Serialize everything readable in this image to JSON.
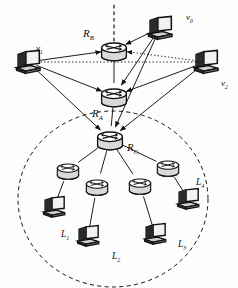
{
  "diagram": {
    "background_color": "#fdfdfd",
    "stroke_color": "#111111",
    "router_fill": "#d9d9d9",
    "host_fill": "#e8e8e8",
    "boundary": {
      "name": "lan-boundary",
      "shape": "dashed-circle",
      "cx": 113,
      "cy": 199,
      "rx": 95,
      "ry": 88,
      "style": "dashed"
    },
    "uplink": {
      "name": "backbone-uplink",
      "style": "dashed",
      "from_x": 114,
      "from_y": 48,
      "to_x": 114,
      "to_y": 2
    },
    "routers": [
      {
        "id": "RB",
        "label": "R",
        "sub": "B",
        "x": 114,
        "y": 50,
        "lx": 83,
        "ly": 28,
        "kind": "backbone"
      },
      {
        "id": "RA",
        "label": "R",
        "sub": "A",
        "x": 114,
        "y": 96,
        "lx": 92,
        "ly": 108,
        "kind": "backbone"
      },
      {
        "id": "RC",
        "label": "R",
        "sub": "C",
        "x": 110,
        "y": 139,
        "lx": 127,
        "ly": 142,
        "kind": "backbone"
      },
      {
        "id": "LR1",
        "label": "",
        "sub": "",
        "x": 68,
        "y": 170,
        "kind": "lan"
      },
      {
        "id": "LR2",
        "label": "",
        "sub": "",
        "x": 97,
        "y": 186,
        "kind": "lan"
      },
      {
        "id": "LR3",
        "label": "",
        "sub": "",
        "x": 140,
        "y": 185,
        "kind": "lan"
      },
      {
        "id": "LR4",
        "label": "",
        "sub": "",
        "x": 168,
        "y": 167,
        "kind": "lan"
      }
    ],
    "hosts": [
      {
        "id": "v0",
        "label": "v",
        "sub": "0",
        "x": 160,
        "y": 28,
        "lx": 186,
        "ly": 13,
        "group": "external"
      },
      {
        "id": "v1",
        "label": "v",
        "sub": "1",
        "x": 28,
        "y": 62,
        "lx": 36,
        "ly": 44,
        "group": "external"
      },
      {
        "id": "v2",
        "label": "v",
        "sub": "2",
        "x": 206,
        "y": 62,
        "lx": 221,
        "ly": 79,
        "group": "external"
      },
      {
        "id": "L1",
        "label": "L",
        "sub": "1",
        "x": 54,
        "y": 207,
        "lx": 61,
        "ly": 230,
        "group": "lan"
      },
      {
        "id": "L2",
        "label": "L",
        "sub": "2",
        "x": 88,
        "y": 236,
        "lx": 112,
        "ly": 252,
        "group": "lan"
      },
      {
        "id": "L3",
        "label": "L",
        "sub": "3",
        "x": 155,
        "y": 234,
        "lx": 178,
        "ly": 240,
        "group": "lan"
      },
      {
        "id": "L4",
        "label": "L",
        "sub": "4",
        "x": 188,
        "y": 199,
        "lx": 196,
        "ly": 178,
        "group": "lan"
      }
    ],
    "links": [
      {
        "from": "RB",
        "to": "RA",
        "style": "solid",
        "arrow": "none"
      },
      {
        "from": "RA",
        "to": "RC",
        "style": "solid",
        "arrow": "none"
      },
      {
        "from": "v1",
        "to": "RB",
        "style": "solid",
        "arrow": "to"
      },
      {
        "from": "v1",
        "to": "RA",
        "style": "solid",
        "arrow": "to"
      },
      {
        "from": "v1",
        "to": "RC",
        "style": "solid",
        "arrow": "to"
      },
      {
        "from": "v0",
        "to": "RB",
        "style": "solid",
        "arrow": "to"
      },
      {
        "from": "v0",
        "to": "RA",
        "style": "solid",
        "arrow": "to"
      },
      {
        "from": "v0",
        "to": "RC",
        "style": "solid",
        "arrow": "to"
      },
      {
        "from": "v2",
        "to": "RB",
        "style": "dotted",
        "arrow": "to"
      },
      {
        "from": "v2",
        "to": "RA",
        "style": "solid",
        "arrow": "to"
      },
      {
        "from": "v2",
        "to": "RC",
        "style": "solid",
        "arrow": "to"
      },
      {
        "from": "v1",
        "to": "v2",
        "style": "dotted",
        "arrow": "none"
      },
      {
        "from": "RC",
        "to": "LR1",
        "style": "solid",
        "arrow": "none"
      },
      {
        "from": "RC",
        "to": "LR2",
        "style": "solid",
        "arrow": "none"
      },
      {
        "from": "RC",
        "to": "LR3",
        "style": "solid",
        "arrow": "none"
      },
      {
        "from": "RC",
        "to": "LR4",
        "style": "solid",
        "arrow": "none"
      },
      {
        "from": "LR1",
        "to": "L1",
        "style": "solid",
        "arrow": "none"
      },
      {
        "from": "LR2",
        "to": "L2",
        "style": "solid",
        "arrow": "none"
      },
      {
        "from": "LR3",
        "to": "L3",
        "style": "solid",
        "arrow": "none"
      },
      {
        "from": "LR4",
        "to": "L4",
        "style": "solid",
        "arrow": "none"
      }
    ]
  }
}
